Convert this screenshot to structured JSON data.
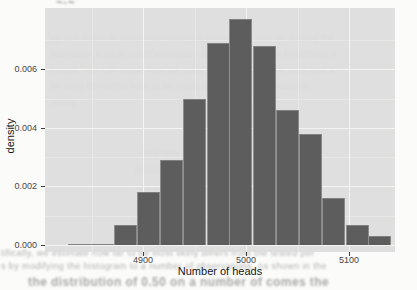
{
  "figure": {
    "x_axis_title": "Number of heads",
    "y_axis_title": "density"
  },
  "chart_data": {
    "type": "bar",
    "subtype": "histogram",
    "title": "",
    "xlabel": "Number of heads",
    "ylabel": "density",
    "legend": false,
    "grid": true,
    "panel_color": "#dcdcdc",
    "bar_color": "#5d5d5d",
    "xlim": [
      4805,
      5145
    ],
    "ylim": [
      0,
      0.0081
    ],
    "x_tick_values": [
      4900,
      5000,
      5100
    ],
    "x_tick_labels": [
      "4900",
      "5000",
      "5100"
    ],
    "x_minor_ticks": [
      4850,
      4950,
      5050
    ],
    "y_tick_values": [
      0,
      0.002,
      0.004,
      0.006
    ],
    "y_tick_labels": [
      "0.000",
      "0.002",
      "0.004",
      "0.006"
    ],
    "y_minor_ticks": [
      0.001,
      0.003,
      0.005,
      0.007
    ],
    "bin_width": 22.5,
    "bins": [
      {
        "center": 4838,
        "density": 5e-05
      },
      {
        "center": 4861,
        "density": 5e-05
      },
      {
        "center": 4883,
        "density": 0.0007
      },
      {
        "center": 4905,
        "density": 0.0018
      },
      {
        "center": 4928,
        "density": 0.0029
      },
      {
        "center": 4950,
        "density": 0.005
      },
      {
        "center": 4973,
        "density": 0.0069
      },
      {
        "center": 4995,
        "density": 0.0077
      },
      {
        "center": 5018,
        "density": 0.0068
      },
      {
        "center": 5040,
        "density": 0.0046
      },
      {
        "center": 5063,
        "density": 0.0038
      },
      {
        "center": 5085,
        "density": 0.0016
      },
      {
        "center": 5108,
        "density": 0.0007
      },
      {
        "center": 5130,
        "density": 0.0003
      }
    ]
  },
  "background_text": {
    "fragments": [
      {
        "x": 56,
        "y": -4,
        "size": 12,
        "weight": 700,
        "opacity": 0.75,
        "text": "~·~"
      },
      {
        "x": 50,
        "y": 33,
        "size": 9,
        "weight": 400,
        "opacity": 0.55,
        "text": "ap see it b/w or about the transport input. This was as among the"
      },
      {
        "x": 50,
        "y": 49,
        "size": 9,
        "weight": 400,
        "opacity": 0.5,
        "text": "has taken a what could anticipate region of the world to achieve a"
      },
      {
        "x": 50,
        "y": 65,
        "size": 9,
        "weight": 400,
        "opacity": 0.5,
        "text": "comes. We can linear how we good with they however had new a"
      },
      {
        "x": 50,
        "y": 81,
        "size": 9,
        "weight": 400,
        "opacity": 0.5,
        "text": "for him) 5% of the how to be multiplied soundly simulated a"
      },
      {
        "x": 50,
        "y": 97,
        "size": 9,
        "weight": 400,
        "opacity": 0.45,
        "text": "orking"
      },
      {
        "x": 140,
        "y": 148,
        "size": 9,
        "weight": 400,
        "opacity": 0.5,
        "text": "atch may a"
      },
      {
        "x": 135,
        "y": 165,
        "size": 9,
        "weight": 400,
        "opacity": 0.5,
        "text": "ailable you th"
      },
      {
        "x": 135,
        "y": 182,
        "size": 9,
        "weight": 400,
        "opacity": 0.5,
        "text": "ces soon pr"
      },
      {
        "x": 135,
        "y": 199,
        "size": 9,
        "weight": 400,
        "opacity": 0.5,
        "text": "olutions"
      },
      {
        "x": 130,
        "y": 216,
        "size": 9,
        "weight": 400,
        "opacity": 0.5,
        "text": "oves this well wholemans"
      },
      {
        "x": 1,
        "y": 248,
        "size": 9,
        "weight": 400,
        "opacity": 0.6,
        "text": "tifically, we estimate how far to be most likely differs from the tested per"
      },
      {
        "x": 1,
        "y": 261,
        "size": 9,
        "weight": 400,
        "opacity": 0.6,
        "text": "s by modifying the histogram to a number of observations. As shown in the"
      },
      {
        "x": 28,
        "y": 275,
        "size": 12,
        "weight": 700,
        "opacity": 0.65,
        "text": "the distribution of 0.50 on a number of comes the"
      }
    ]
  }
}
